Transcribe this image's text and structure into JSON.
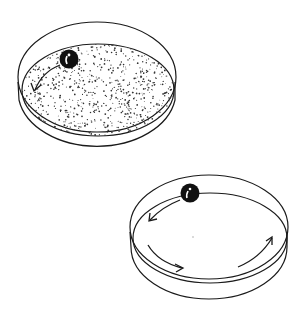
{
  "figure": {
    "colors": {
      "stroke": "#1a1a1a",
      "ball": "#111111",
      "highlight": "#ffffff",
      "background": "#ffffff"
    },
    "dishes": [
      {
        "id": "textured-dish",
        "surface": "dotted",
        "arrows": 1,
        "ball": {
          "position": "upper-left rim"
        }
      },
      {
        "id": "smooth-dish",
        "surface": "smooth",
        "arrows": 3,
        "ball": {
          "position": "upper rim"
        }
      }
    ]
  }
}
